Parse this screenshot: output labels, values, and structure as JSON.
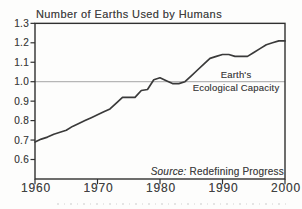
{
  "chart_data": {
    "type": "line",
    "title": "Number of Earths Used by Humans",
    "xlabel": "",
    "ylabel": "",
    "x": [
      1960,
      1961,
      1962,
      1963,
      1964,
      1965,
      1966,
      1967,
      1968,
      1969,
      1970,
      1971,
      1972,
      1973,
      1974,
      1975,
      1976,
      1977,
      1978,
      1979,
      1980,
      1981,
      1982,
      1983,
      1984,
      1985,
      1986,
      1987,
      1988,
      1989,
      1990,
      1991,
      1992,
      1993,
      1994,
      1995,
      1996,
      1997,
      1998,
      1999,
      2000
    ],
    "series": [
      {
        "name": "Number of Earths Used by Humans",
        "values": [
          0.69,
          0.705,
          0.715,
          0.73,
          0.74,
          0.75,
          0.77,
          0.785,
          0.8,
          0.815,
          0.83,
          0.845,
          0.86,
          0.89,
          0.92,
          0.92,
          0.92,
          0.955,
          0.96,
          1.01,
          1.02,
          1.005,
          0.99,
          0.99,
          1.0,
          1.03,
          1.06,
          1.09,
          1.12,
          1.13,
          1.14,
          1.14,
          1.13,
          1.13,
          1.13,
          1.15,
          1.17,
          1.19,
          1.2,
          1.21,
          1.21
        ]
      }
    ],
    "x_ticks": [
      1960,
      1970,
      1980,
      1990,
      2000
    ],
    "y_ticks": [
      "1.3",
      "1.2",
      "1.1",
      "1.0",
      "0.9",
      "0.8",
      "0.7",
      "0.6"
    ],
    "xlim": [
      1960,
      2000
    ],
    "ylim": [
      0.5,
      1.3
    ],
    "grid": false,
    "legend": "none",
    "reference_line": {
      "y": 1.0,
      "label": [
        "Earth's",
        "Ecological Capacity"
      ]
    },
    "source": {
      "prefix": "Source:",
      "text": " Redefining Progress"
    },
    "colors": {
      "curve": "#3a3a3a",
      "reference_line": "#b6b6b6",
      "frame": "#303030",
      "text": "#414141",
      "background": "#fdfdfc"
    }
  }
}
